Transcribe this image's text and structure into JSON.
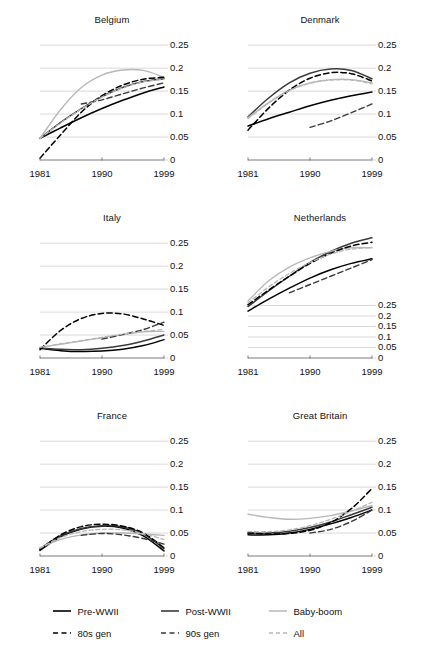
{
  "chart_data": {
    "type": "line",
    "title": "",
    "xlabel": "",
    "ylabel": "",
    "grid": true,
    "legend_position": "bottom",
    "x": [
      1981,
      1984,
      1987,
      1990,
      1993,
      1996,
      1999
    ],
    "xticks": [
      "1981",
      "1990",
      "1999"
    ],
    "xlim": [
      1981,
      1999
    ],
    "yticks": [
      "0",
      "0.05",
      "0.1",
      "0.15",
      "0.2",
      "0.25"
    ],
    "ytick_values": [
      0,
      0.05,
      0.1,
      0.15,
      0.2,
      0.25
    ],
    "series_names": [
      "Pre-WWII",
      "Post-WWII",
      "Baby-boom",
      "80s gen",
      "90s gen",
      "All"
    ],
    "panels": [
      {
        "name": "Belgium",
        "ylim": [
          0,
          0.27
        ],
        "series": [
          {
            "name": "Pre-WWII",
            "values": [
              0.047,
              0.07,
              0.092,
              0.112,
              0.13,
              0.146,
              0.159
            ]
          },
          {
            "name": "Post-WWII",
            "values": [
              0.047,
              0.082,
              0.112,
              0.138,
              0.158,
              0.171,
              0.177
            ]
          },
          {
            "name": "Baby-boom",
            "values": [
              0.047,
              0.11,
              0.158,
              0.185,
              0.196,
              0.195,
              0.18
            ]
          },
          {
            "name": "80s gen",
            "values": [
              0.004,
              0.055,
              0.104,
              0.14,
              0.163,
              0.176,
              0.18
            ]
          },
          {
            "name": "90s gen",
            "values": [
              null,
              null,
              0.122,
              0.131,
              0.144,
              0.157,
              0.168
            ]
          },
          {
            "name": "All",
            "values": [
              0.047,
              0.081,
              0.111,
              0.137,
              0.157,
              0.17,
              0.176
            ]
          }
        ]
      },
      {
        "name": "Denmark",
        "ylim": [
          0,
          0.27
        ],
        "series": [
          {
            "name": "Pre-WWII",
            "values": [
              0.074,
              0.09,
              0.104,
              0.118,
              0.13,
              0.14,
              0.148
            ]
          },
          {
            "name": "Post-WWII",
            "values": [
              0.094,
              0.135,
              0.168,
              0.189,
              0.198,
              0.195,
              0.177
            ]
          },
          {
            "name": "Baby-boom",
            "values": [
              0.092,
              0.125,
              0.152,
              0.168,
              0.175,
              0.175,
              0.168
            ]
          },
          {
            "name": "80s gen",
            "values": [
              0.065,
              0.113,
              0.152,
              0.178,
              0.19,
              0.188,
              0.172
            ]
          },
          {
            "name": "90s gen",
            "values": [
              null,
              null,
              null,
              0.071,
              0.085,
              0.103,
              0.122
            ]
          },
          {
            "name": "All",
            "values": [
              0.09,
              0.124,
              0.151,
              0.167,
              0.174,
              0.174,
              0.166
            ]
          }
        ]
      },
      {
        "name": "Italy",
        "ylim": [
          0,
          0.27
        ],
        "series": [
          {
            "name": "Pre-WWII",
            "values": [
              0.021,
              0.016,
              0.014,
              0.015,
              0.019,
              0.027,
              0.04
            ]
          },
          {
            "name": "Post-WWII",
            "values": [
              0.022,
              0.019,
              0.018,
              0.021,
              0.027,
              0.037,
              0.05
            ]
          },
          {
            "name": "Baby-boom",
            "values": [
              0.023,
              0.03,
              0.037,
              0.044,
              0.051,
              0.057,
              0.058
            ]
          },
          {
            "name": "80s gen",
            "values": [
              0.018,
              0.06,
              0.086,
              0.097,
              0.096,
              0.085,
              0.071
            ]
          },
          {
            "name": "90s gen",
            "values": [
              null,
              null,
              null,
              0.041,
              0.051,
              0.062,
              0.078
            ]
          },
          {
            "name": "All",
            "values": [
              0.023,
              0.031,
              0.038,
              0.045,
              0.052,
              0.058,
              0.062
            ]
          }
        ]
      },
      {
        "name": "Netherlands",
        "ylim": [
          0,
          0.27
        ],
        "note": "y-axis labels compressed at lower range; curves extend above 0.25",
        "series": [
          {
            "name": "Pre-WWII",
            "values": [
              0.102,
              0.128,
              0.152,
              0.174,
              0.192,
              0.206,
              0.216
            ]
          },
          {
            "name": "Post-WWII",
            "values": [
              0.112,
              0.146,
              0.178,
              0.208,
              0.232,
              0.25,
              0.262
            ]
          },
          {
            "name": "Baby-boom",
            "values": [
              0.124,
              0.168,
              0.198,
              0.218,
              0.232,
              0.24,
              0.24
            ]
          },
          {
            "name": "80s gen",
            "values": [
              0.116,
              0.148,
              0.178,
              0.206,
              0.228,
              0.244,
              0.252
            ]
          },
          {
            "name": "90s gen",
            "values": [
              null,
              null,
              0.142,
              0.16,
              0.178,
              0.196,
              0.214
            ]
          },
          {
            "name": "All",
            "values": [
              0.12,
              0.155,
              0.184,
              0.208,
              0.226,
              0.237,
              0.24
            ]
          }
        ]
      },
      {
        "name": "France",
        "ylim": [
          0,
          0.27
        ],
        "series": [
          {
            "name": "Pre-WWII",
            "values": [
              0.012,
              0.042,
              0.059,
              0.065,
              0.061,
              0.044,
              0.011
            ]
          },
          {
            "name": "Post-WWII",
            "values": [
              0.016,
              0.044,
              0.06,
              0.066,
              0.063,
              0.048,
              0.016
            ]
          },
          {
            "name": "Baby-boom",
            "values": [
              0.018,
              0.036,
              0.046,
              0.05,
              0.05,
              0.048,
              0.045
            ]
          },
          {
            "name": "80s gen",
            "values": [
              0.014,
              0.046,
              0.064,
              0.069,
              0.065,
              0.05,
              0.018
            ]
          },
          {
            "name": "90s gen",
            "values": [
              null,
              null,
              0.045,
              0.049,
              0.046,
              0.038,
              0.026
            ]
          },
          {
            "name": "All",
            "values": [
              0.017,
              0.04,
              0.053,
              0.058,
              0.057,
              0.049,
              0.036
            ]
          }
        ]
      },
      {
        "name": "Great Britain",
        "ylim": [
          0,
          0.27
        ],
        "series": [
          {
            "name": "Pre-WWII",
            "values": [
              0.046,
              0.046,
              0.05,
              0.058,
              0.07,
              0.084,
              0.1
            ]
          },
          {
            "name": "Post-WWII",
            "values": [
              0.05,
              0.05,
              0.054,
              0.062,
              0.074,
              0.09,
              0.106
            ]
          },
          {
            "name": "Baby-boom",
            "values": [
              0.091,
              0.084,
              0.08,
              0.082,
              0.088,
              0.098,
              0.11
            ]
          },
          {
            "name": "80s gen",
            "values": [
              0.05,
              0.048,
              0.049,
              0.056,
              0.073,
              0.103,
              0.147
            ]
          },
          {
            "name": "90s gen",
            "values": [
              null,
              null,
              null,
              0.05,
              0.058,
              0.075,
              0.1
            ]
          },
          {
            "name": "All",
            "values": [
              0.053,
              0.053,
              0.057,
              0.066,
              0.08,
              0.097,
              0.117
            ]
          }
        ]
      }
    ]
  },
  "legend": {
    "items": [
      {
        "label": "Pre-WWII",
        "style": "solid",
        "color": "#000000"
      },
      {
        "label": "Post-WWII",
        "style": "solid",
        "color": "#3a3a3a"
      },
      {
        "label": "Baby-boom",
        "style": "solid",
        "color": "#b7b7b7"
      },
      {
        "label": "80s gen",
        "style": "dashed",
        "color": "#000000"
      },
      {
        "label": "90s gen",
        "style": "dashed",
        "color": "#3a3a3a"
      },
      {
        "label": "All",
        "style": "dashed",
        "color": "#b7b7b7"
      }
    ]
  }
}
